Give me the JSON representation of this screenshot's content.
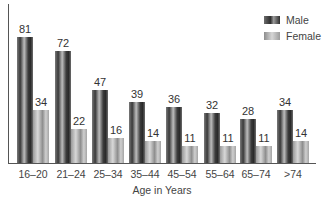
{
  "chart_data": {
    "type": "bar",
    "title": "",
    "xlabel": "Age in Years",
    "ylabel": "",
    "categories": [
      "16–20",
      "21–24",
      "25–34",
      "35–44",
      "45–54",
      "55–64",
      "65–74",
      ">74"
    ],
    "series": [
      {
        "name": "Male",
        "values": [
          81,
          72,
          47,
          39,
          36,
          32,
          28,
          34
        ]
      },
      {
        "name": "Female",
        "values": [
          34,
          22,
          16,
          14,
          11,
          11,
          11,
          14
        ]
      }
    ],
    "ylim": [
      0,
      100
    ],
    "grid": false,
    "legend_position": "top-right",
    "data_labels": true
  },
  "legend": {
    "male": "Male",
    "female": "Female"
  },
  "xaxis_title": "Age in Years",
  "categories": [
    "16–20",
    "21–24",
    "25–34",
    "35–44",
    "45–54",
    "55–64",
    "65–74",
    ">74"
  ],
  "male_labels": [
    "81",
    "72",
    "47",
    "39",
    "36",
    "32",
    "28",
    "34"
  ],
  "female_labels": [
    "34",
    "22",
    "16",
    "14",
    "11",
    "11",
    "11",
    "14"
  ]
}
